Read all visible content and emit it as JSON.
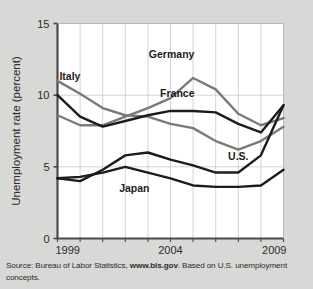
{
  "figure": {
    "background_color": "#d8d8d6",
    "plot_background_color": "#ffffff"
  },
  "source": {
    "prefix": "Source: Bureau of Labor Statistics, ",
    "link": "www.bls.gov",
    "suffix": ". Based on U.S. unemployment concepts."
  },
  "chart_data": {
    "type": "line",
    "title": "",
    "xlabel": "",
    "ylabel": "Unemployment rate (percent)",
    "x": [
      1999,
      2000,
      2001,
      2002,
      2003,
      2004,
      2005,
      2006,
      2007,
      2008,
      2009
    ],
    "xtick_labels": [
      "1999",
      "2004",
      "2009"
    ],
    "xticks": [
      1999,
      2004,
      2009
    ],
    "xlim": [
      1999,
      2009
    ],
    "ytick_labels": [
      "0",
      "5",
      "10",
      "15"
    ],
    "yticks": [
      0,
      5,
      10,
      15
    ],
    "ylim": [
      0,
      15
    ],
    "grid": true,
    "grid_color": "#c9c9c9",
    "legend": "inline-annotations",
    "series": [
      {
        "name": "Germany",
        "color": "#7a7a7a",
        "width": 2.4,
        "label_x": 2004.05,
        "label_y": 12.6,
        "values": [
          8.6,
          7.9,
          7.9,
          8.5,
          9.1,
          9.8,
          11.2,
          10.4,
          8.7,
          7.9,
          8.4
        ]
      },
      {
        "name": "Italy",
        "color": "#7a7a7a",
        "width": 2.4,
        "label_x": 1999.55,
        "label_y": 11.05,
        "values": [
          11.0,
          10.1,
          9.1,
          8.6,
          8.5,
          8.0,
          7.7,
          6.8,
          6.2,
          6.8,
          7.8
        ]
      },
      {
        "name": "France",
        "color": "#1c1c1c",
        "width": 2.4,
        "label_x": 2004.3,
        "label_y": 9.9,
        "values": [
          10.0,
          8.5,
          7.8,
          8.2,
          8.6,
          8.9,
          8.9,
          8.8,
          8.0,
          7.4,
          9.3
        ]
      },
      {
        "name": "U.S.",
        "color": "#1c1c1c",
        "width": 2.4,
        "label_x": 2007.0,
        "label_y": 5.45,
        "values": [
          4.2,
          4.0,
          4.8,
          5.8,
          6.0,
          5.5,
          5.1,
          4.6,
          4.6,
          5.8,
          9.3
        ]
      },
      {
        "name": "Japan",
        "color": "#1c1c1c",
        "width": 2.4,
        "label_x": 2002.4,
        "label_y": 3.25,
        "values": [
          4.2,
          4.3,
          4.6,
          5.0,
          4.6,
          4.2,
          3.7,
          3.6,
          3.6,
          3.7,
          4.8
        ]
      }
    ]
  }
}
